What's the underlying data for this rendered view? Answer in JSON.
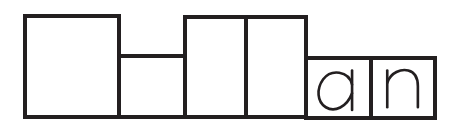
{
  "diagram": {
    "type": "word-shape-boxes",
    "stroke_color": "#231f20",
    "background_color": "#ffffff",
    "word_ending": "an",
    "boxes": [
      {
        "index": 0,
        "shape": "tall",
        "letter": ""
      },
      {
        "index": 1,
        "shape": "short",
        "letter": ""
      },
      {
        "index": 2,
        "shape": "tall",
        "letter": ""
      },
      {
        "index": 3,
        "shape": "tall",
        "letter": ""
      },
      {
        "index": 4,
        "shape": "short",
        "letter": "a"
      },
      {
        "index": 5,
        "shape": "short",
        "letter": "n"
      }
    ]
  }
}
